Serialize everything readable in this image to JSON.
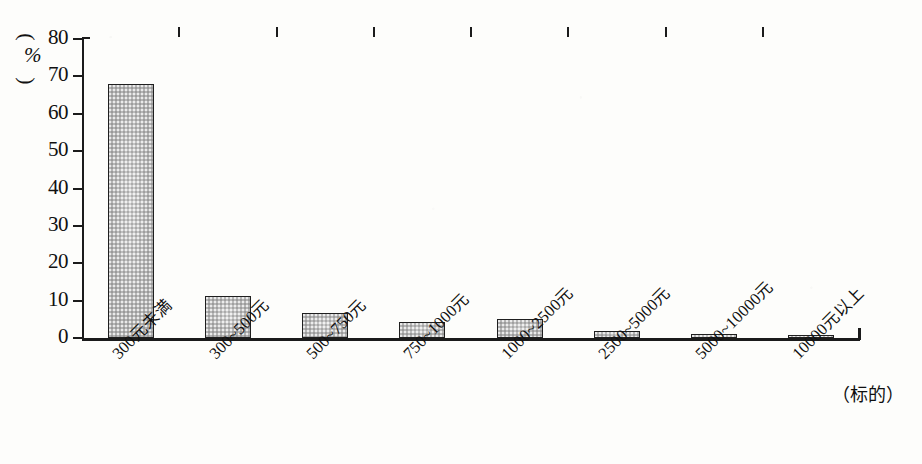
{
  "chart_data": {
    "type": "bar",
    "title": "",
    "subtitle": "",
    "xlabel": "（标的）",
    "ylabel": "（%）",
    "unit": "%",
    "grid": false,
    "legend": "none",
    "ylim": [
      0,
      80
    ],
    "ytick_step": 10,
    "yticks": [
      "80",
      "70",
      "60",
      "50",
      "40",
      "30",
      "20",
      "10",
      "0"
    ],
    "categories": [
      "300元未満",
      "300~500元",
      "500~750元",
      "750~1000元",
      "1000~2500元",
      "2500~5000元",
      "5000~10000元",
      "10000元以上"
    ],
    "values": [
      68,
      11.3,
      6.8,
      4.4,
      5.1,
      2.0,
      1.2,
      0.4
    ],
    "bar_color": "#b4b4b4",
    "bar_edge_color": "#1f1f1f",
    "axis_color": "#1b1b1b",
    "background_color": "#fdfdfb"
  },
  "axis_unit": {
    "open_paren": "⌢",
    "close_paren": "⌣",
    "symbol": "%"
  }
}
